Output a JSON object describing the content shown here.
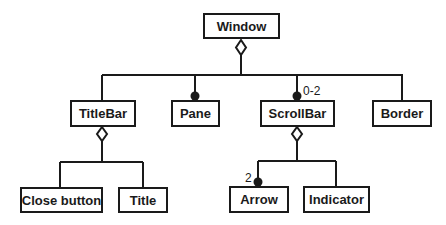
{
  "diagram": {
    "type": "UML class diagram (composition/aggregation hierarchy)",
    "colors": {
      "stroke": "#1a1a1a",
      "fill": "#ffffff"
    },
    "nodes": {
      "window": {
        "label": "Window"
      },
      "titlebar": {
        "label": "TitleBar"
      },
      "pane": {
        "label": "Pane"
      },
      "scrollbar": {
        "label": "ScrollBar"
      },
      "border": {
        "label": "Border"
      },
      "close_button": {
        "label": "Close button"
      },
      "title": {
        "label": "Title"
      },
      "arrow": {
        "label": "Arrow"
      },
      "indicator": {
        "label": "Indicator"
      }
    },
    "multiplicities": {
      "scrollbar": "0-2",
      "arrow": "2"
    },
    "edges": [
      {
        "from": "Window",
        "to": "TitleBar",
        "kind": "aggregation"
      },
      {
        "from": "Window",
        "to": "Pane",
        "kind": "aggregation",
        "end": "filled-dot"
      },
      {
        "from": "Window",
        "to": "ScrollBar",
        "kind": "aggregation",
        "end": "filled-dot",
        "multiplicity": "0-2"
      },
      {
        "from": "Window",
        "to": "Border",
        "kind": "aggregation"
      },
      {
        "from": "TitleBar",
        "to": "Close button",
        "kind": "aggregation"
      },
      {
        "from": "TitleBar",
        "to": "Title",
        "kind": "aggregation"
      },
      {
        "from": "ScrollBar",
        "to": "Arrow",
        "kind": "aggregation",
        "end": "filled-dot",
        "multiplicity": "2"
      },
      {
        "from": "ScrollBar",
        "to": "Indicator",
        "kind": "aggregation"
      }
    ]
  }
}
